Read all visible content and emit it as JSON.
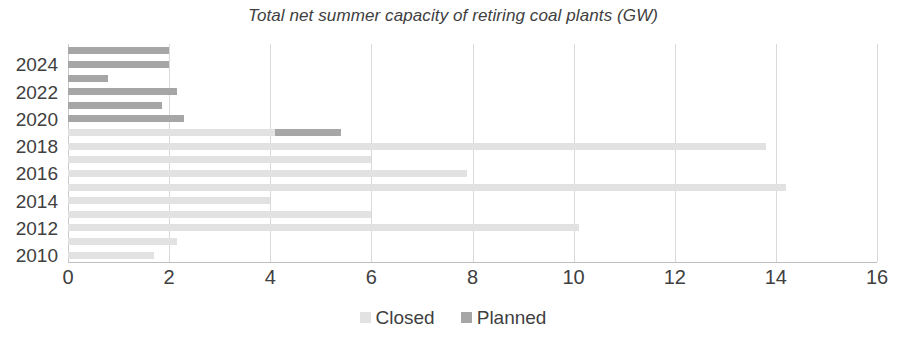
{
  "chart_data": {
    "type": "bar",
    "orientation": "horizontal",
    "stacked": true,
    "title": "Total net summer capacity of retiring coal plants (GW)",
    "xlabel": "",
    "ylabel": "",
    "xlim": [
      0,
      16
    ],
    "xticks": [
      0,
      2,
      4,
      6,
      8,
      10,
      12,
      14,
      16
    ],
    "xtick_labels": [
      "0",
      "2",
      "4",
      "6",
      "8",
      "10",
      "12",
      "14",
      "16"
    ],
    "categories": [
      2025,
      2024,
      2023,
      2022,
      2021,
      2020,
      2019,
      2018,
      2017,
      2016,
      2015,
      2014,
      2013,
      2012,
      2011,
      2010
    ],
    "ytick_labels": [
      "2024",
      "2022",
      "2020",
      "2018",
      "2016",
      "2014",
      "2012",
      "2010"
    ],
    "grid": "vertical",
    "legend_position": "bottom",
    "series": [
      {
        "name": "Closed",
        "color": "#e2e2e2",
        "values": [
          0,
          0,
          0,
          0,
          0,
          0,
          4.1,
          13.8,
          6.0,
          7.9,
          14.2,
          4.0,
          6.0,
          10.1,
          2.15,
          1.7
        ]
      },
      {
        "name": "Planned",
        "color": "#a6a6a6",
        "values": [
          2.0,
          2.0,
          0.8,
          2.15,
          1.85,
          2.3,
          1.3,
          0,
          0,
          0,
          0,
          0,
          0,
          0,
          0,
          0
        ]
      }
    ]
  },
  "legend": {
    "items": [
      {
        "label": "Closed",
        "color": "#e2e2e2"
      },
      {
        "label": "Planned",
        "color": "#a6a6a6"
      }
    ]
  },
  "axis": {
    "grid_color": "#d9d9d9",
    "axis_color": "#bfbfbf",
    "text_color": "#404040"
  }
}
